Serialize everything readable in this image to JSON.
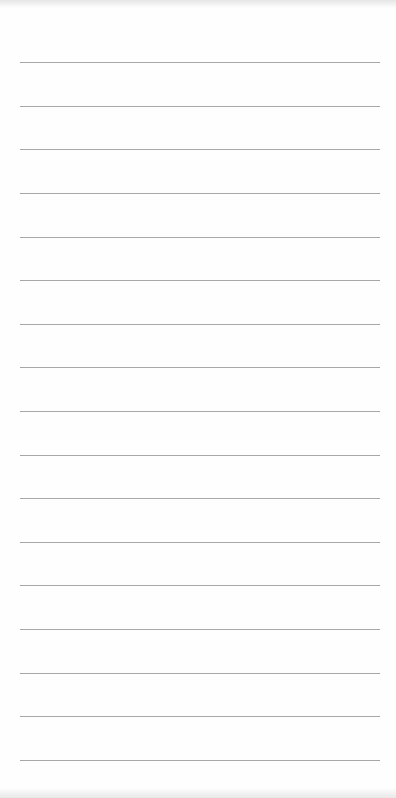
{
  "paper": {
    "type": "lined-paper",
    "background_color": "#fefefe",
    "line_color": "#a8a8a8",
    "line_count": 17,
    "line_positions": [
      62,
      106,
      149,
      193,
      237,
      280,
      324,
      367,
      411,
      455,
      498,
      542,
      585,
      629,
      673,
      716,
      760
    ]
  }
}
